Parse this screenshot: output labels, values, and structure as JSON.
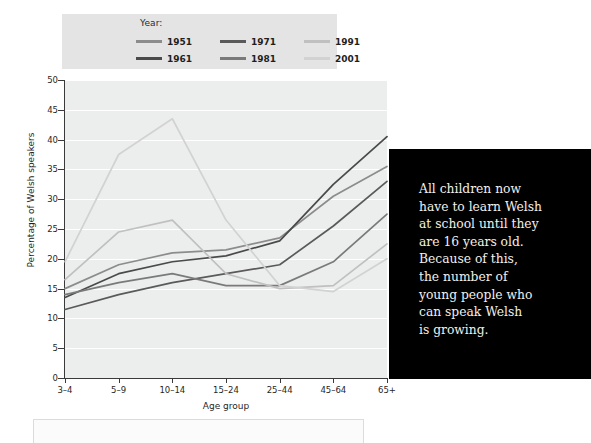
{
  "legend": {
    "title": "Year:",
    "entries": [
      {
        "label": "1951",
        "color": "#8c8c8c"
      },
      {
        "label": "1971",
        "color": "#5a5a5a"
      },
      {
        "label": "1991",
        "color": "#c0c0c0"
      },
      {
        "label": "1961",
        "color": "#4a4a4a"
      },
      {
        "label": "1981",
        "color": "#7a7a7a"
      },
      {
        "label": "2001",
        "color": "#d2d2d2"
      }
    ]
  },
  "callout": {
    "text": "All children now\nhave to learn Welsh\nat school until they\nare 16 years old.\nBecause of this,\nthe number of\nyoung people who\ncan speak Welsh\nis growing.",
    "background": "#000000",
    "text_color": "#f2f0ec"
  },
  "colors": {
    "plot_background": "#eceded",
    "gridline": "#ffffff",
    "axis": "#3a3a3a",
    "legend_background": "#e4e4e4"
  },
  "chart_data": {
    "type": "line",
    "title": "",
    "xlabel": "Age group",
    "ylabel": "Percentage of Welsh speakers",
    "categories": [
      "3–4",
      "5–9",
      "10–14",
      "15–24",
      "25–44",
      "45–64",
      "65+"
    ],
    "ylim": [
      0,
      50
    ],
    "yticks": [
      0,
      5,
      10,
      15,
      20,
      25,
      30,
      35,
      40,
      45,
      50
    ],
    "grid": true,
    "legend_position": "top-left",
    "series": [
      {
        "name": "1951",
        "color": "#8c8c8c",
        "values": [
          15.0,
          19.0,
          21.0,
          21.5,
          23.5,
          30.5,
          35.5
        ]
      },
      {
        "name": "1961",
        "color": "#4a4a4a",
        "values": [
          13.5,
          17.5,
          19.5,
          20.5,
          23.0,
          32.5,
          40.5
        ]
      },
      {
        "name": "1971",
        "color": "#5a5a5a",
        "values": [
          11.5,
          14.0,
          16.0,
          17.5,
          19.0,
          25.5,
          33.0
        ]
      },
      {
        "name": "1981",
        "color": "#7a7a7a",
        "values": [
          14.0,
          16.0,
          17.5,
          15.5,
          15.5,
          19.5,
          27.5
        ]
      },
      {
        "name": "1991",
        "color": "#c0c0c0",
        "values": [
          16.5,
          24.5,
          26.5,
          17.5,
          15.0,
          15.5,
          22.5
        ]
      },
      {
        "name": "2001",
        "color": "#d2d2d2",
        "values": [
          19.5,
          37.5,
          43.5,
          26.5,
          15.5,
          14.5,
          20.0
        ]
      }
    ]
  }
}
